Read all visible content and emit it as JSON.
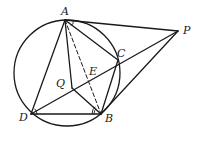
{
  "diagram": {
    "type": "geometry",
    "colors": {
      "stroke": "#1a1a1a",
      "background": "#ffffff"
    },
    "circle": {
      "cx": 67,
      "cy": 73,
      "r": 53
    },
    "points": {
      "A": {
        "label": "A",
        "x": 65,
        "y": 20
      },
      "P": {
        "label": "P",
        "x": 178,
        "y": 31
      },
      "C": {
        "label": "C",
        "x": 118,
        "y": 60
      },
      "E": {
        "label": "E",
        "x": 88,
        "y": 73
      },
      "Q": {
        "label": "Q",
        "x": 72,
        "y": 88
      },
      "D": {
        "label": "D",
        "x": 31,
        "y": 114
      },
      "B": {
        "label": "B",
        "x": 101,
        "y": 114
      }
    },
    "segments": [
      [
        "A",
        "P"
      ],
      [
        "P",
        "D"
      ],
      [
        "P",
        "B"
      ],
      [
        "A",
        "D"
      ],
      [
        "A",
        "Q"
      ],
      [
        "A",
        "C"
      ],
      [
        "D",
        "B"
      ],
      [
        "Q",
        "B"
      ],
      [
        "C",
        "B"
      ]
    ],
    "dashed_segments": [
      [
        "A",
        "B"
      ]
    ],
    "angle_marks": [
      "angle-PAC",
      "angle-ADB",
      "angle-DBQ"
    ]
  }
}
